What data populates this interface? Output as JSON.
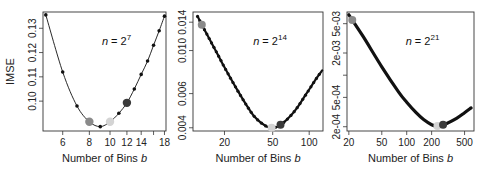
{
  "chart_data": [
    {
      "type": "line",
      "panel": 1,
      "annotation": {
        "base": "n = 2",
        "exponent": "7"
      },
      "xlabel": "Number of Bins b",
      "ylabel": "IMSE",
      "xscale": "log",
      "xlim": [
        4.85,
        18.3
      ],
      "ylim": [
        0.0877,
        0.1367
      ],
      "xticks": [
        6,
        8,
        10,
        12,
        14,
        16,
        18
      ],
      "xtick_labels": [
        "6",
        "8",
        "10",
        "12",
        "14",
        "",
        "18"
      ],
      "yticks": [
        0.1,
        0.11,
        0.12,
        0.13
      ],
      "ytick_labels": [
        "0.10",
        "0.11",
        "0.12",
        "0.13"
      ],
      "x": [
        5,
        6,
        7,
        8,
        9,
        10,
        11,
        12,
        13,
        14,
        15,
        16,
        17,
        18
      ],
      "y": [
        0.1355,
        0.112,
        0.098,
        0.0915,
        0.0895,
        0.0915,
        0.095,
        0.0993,
        0.105,
        0.111,
        0.1165,
        0.123,
        0.129,
        0.135
      ],
      "highlights": [
        {
          "x": 8,
          "y": 0.0915,
          "color": "#8a8a8a"
        },
        {
          "x": 10,
          "y": 0.0915,
          "color": "#d4d4d4"
        },
        {
          "x": 12,
          "y": 0.0993,
          "color": "#3a3a3a"
        }
      ]
    },
    {
      "type": "line",
      "panel": 2,
      "annotation": {
        "base": "n = 2",
        "exponent": "14"
      },
      "xlabel": "Number of Bins b",
      "ylabel": "",
      "xscale": "log",
      "yscale": "log",
      "xlim": [
        11,
        130
      ],
      "ylim": [
        0.00385,
        0.0158
      ],
      "xticks": [
        20,
        50,
        100
      ],
      "xtick_labels": [
        "20",
        "50",
        "100"
      ],
      "yticks": [
        0.004,
        0.006,
        0.01,
        0.014
      ],
      "ytick_labels": [
        "0.004",
        "0.006",
        "0.010",
        "0.014"
      ],
      "x": [
        12,
        13,
        15,
        18,
        20,
        25,
        30,
        35,
        40,
        45,
        49,
        55,
        60,
        70,
        80,
        90,
        100,
        115,
        128
      ],
      "y": [
        0.015,
        0.0136,
        0.0115,
        0.0093,
        0.0082,
        0.0064,
        0.0053,
        0.0046,
        0.00425,
        0.00405,
        0.004,
        0.00405,
        0.0042,
        0.0046,
        0.0051,
        0.0057,
        0.0063,
        0.0072,
        0.0079
      ],
      "highlights": [
        {
          "x": 13,
          "y": 0.0136,
          "color": "#8a8a8a"
        },
        {
          "x": 49,
          "y": 0.004,
          "color": "#d4d4d4"
        },
        {
          "x": 58,
          "y": 0.00415,
          "color": "#3a3a3a"
        }
      ]
    },
    {
      "type": "line",
      "panel": 3,
      "annotation": {
        "base": "n = 2",
        "exponent": "21"
      },
      "xlabel": "Number of Bins b",
      "ylabel": "",
      "xscale": "log",
      "yscale": "log",
      "xlim": [
        19,
        650
      ],
      "ylim": [
        0.000175,
        0.0072
      ],
      "xticks": [
        20,
        50,
        100,
        200,
        500
      ],
      "xtick_labels": [
        "20",
        "50",
        "100",
        "200",
        "500"
      ],
      "yticks": [
        0.0002,
        0.0005,
        0.001,
        0.002,
        0.005
      ],
      "ytick_labels": [
        "2e-04",
        "5e-04",
        "",
        "2e-03",
        "5e-03"
      ],
      "x": [
        20,
        22,
        30,
        50,
        80,
        100,
        130,
        160,
        200,
        230,
        260,
        300,
        400,
        500,
        600
      ],
      "y": [
        0.0066,
        0.0056,
        0.0033,
        0.0013,
        0.00059,
        0.00043,
        0.00031,
        0.00025,
        0.000213,
        0.000205,
        0.000208,
        0.00022,
        0.00026,
        0.00031,
        0.00036
      ],
      "highlights": [
        {
          "x": 22,
          "y": 0.0056,
          "color": "#8a8a8a"
        },
        {
          "x": 235,
          "y": 0.000205,
          "color": "#d4d4d4"
        },
        {
          "x": 275,
          "y": 0.000212,
          "color": "#3a3a3a"
        }
      ]
    }
  ]
}
